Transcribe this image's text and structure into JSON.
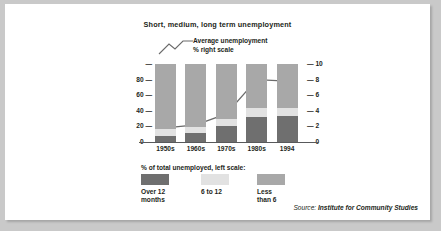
{
  "chart_data": {
    "type": "bar",
    "title": "Short, medium, long term unemployment",
    "categories": [
      "1950s",
      "1960s",
      "1970s",
      "1980s",
      "1994"
    ],
    "stacked": true,
    "series": [
      {
        "name": "Over 12 months",
        "values": [
          8,
          11,
          20,
          32,
          33
        ],
        "color": "#6f6f6f"
      },
      {
        "name": "6 to 12",
        "values": [
          9,
          8,
          9,
          12,
          11
        ],
        "color": "#e2e2e2"
      },
      {
        "name": "Less than 6",
        "values": [
          83,
          81,
          71,
          56,
          56
        ],
        "color": "#a8a8a8"
      }
    ],
    "line_series": {
      "name": "Average unemployment % right scale",
      "values": [
        1.8,
        2.2,
        3.6,
        8.0,
        7.8
      ],
      "color": "#6b6b6b",
      "axis": "right"
    },
    "ylabel": "",
    "xlabel": "",
    "ylim": [
      0,
      100
    ],
    "yticks": [
      "0",
      "20",
      "40",
      "60",
      "80",
      ""
    ],
    "y2lim": [
      0,
      10
    ],
    "y2ticks": [
      "0",
      "2",
      "4",
      "6",
      "8",
      "10"
    ],
    "grid": false,
    "legend_position": "bottom"
  },
  "annotation": {
    "line1": "Average unemployment",
    "line2": "% right scale"
  },
  "legend": {
    "title": "% of total unemployed, left scale:",
    "items": [
      {
        "label": "Over 12\nmonths",
        "color": "#6f6f6f"
      },
      {
        "label": "6 to 12",
        "color": "#e2e2e2"
      },
      {
        "label": "Less\nthan 6",
        "color": "#a8a8a8"
      }
    ]
  },
  "source": {
    "prefix": "Source: ",
    "name": "Institute for Community Studies"
  }
}
